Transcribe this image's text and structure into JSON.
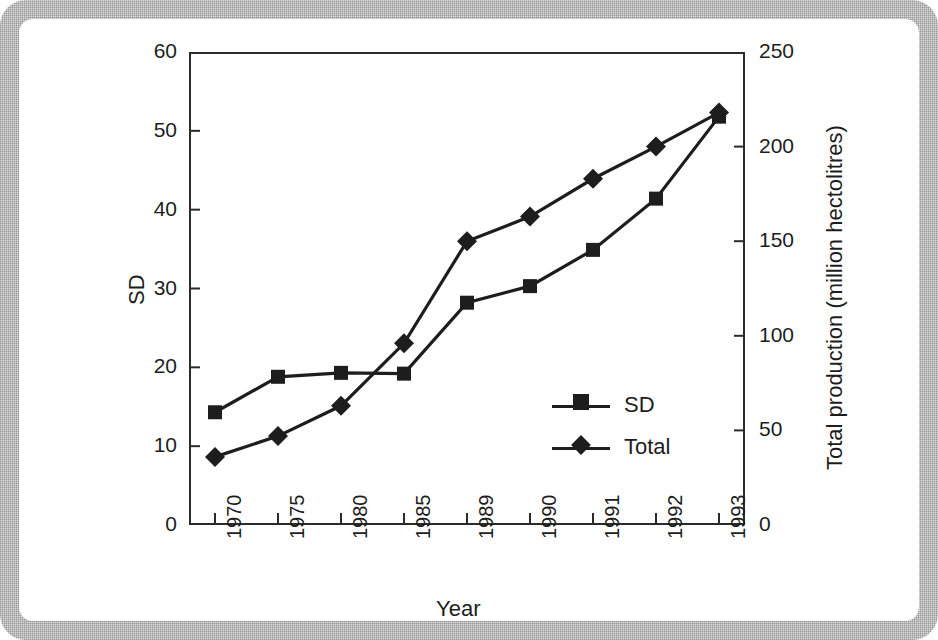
{
  "chart_data": {
    "type": "line",
    "title": "",
    "subtitle": "",
    "xlabel": "Year",
    "ylabel": "SD",
    "y2label": "Total production (million hectolitres)",
    "categories": [
      "1970",
      "1975",
      "1980",
      "1985",
      "1989",
      "1990",
      "1991",
      "1992",
      "1993"
    ],
    "ylim": [
      0,
      60
    ],
    "y2lim": [
      0,
      250
    ],
    "yticks": [
      0,
      10,
      20,
      30,
      40,
      50,
      60
    ],
    "y2ticks": [
      0,
      50,
      100,
      150,
      200,
      250
    ],
    "grid": false,
    "legend_position": "inside-center-right",
    "series": [
      {
        "name": "SD",
        "axis": "left",
        "marker": "square",
        "color": "#1d1d1d",
        "values": [
          14.3,
          18.8,
          19.3,
          19.2,
          28.2,
          30.3,
          34.9,
          41.4,
          51.8
        ]
      },
      {
        "name": "Total",
        "axis": "right",
        "marker": "diamond",
        "color": "#1d1d1d",
        "values": [
          36,
          47,
          63,
          96,
          150,
          163,
          183,
          200,
          218
        ]
      }
    ]
  },
  "legend": {
    "items": [
      {
        "label": "SD",
        "marker": "square"
      },
      {
        "label": "Total",
        "marker": "diamond"
      }
    ]
  },
  "axes": {
    "left_title": "SD",
    "right_title": "Total production (million hectolitres)",
    "bottom_title": "Year"
  }
}
